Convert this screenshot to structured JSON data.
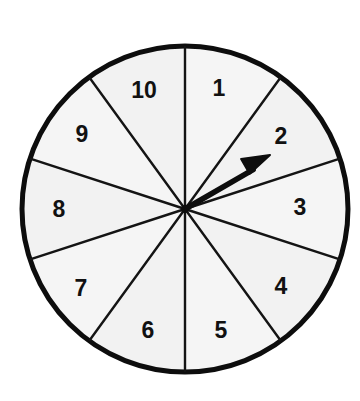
{
  "figure": {
    "kind": "probability-spinner",
    "background_color": "#ffffff"
  },
  "chart_data": {
    "type": "pie",
    "subtitle": "",
    "xlabel": "",
    "ylabel": "",
    "legend_position": "none",
    "grid": false,
    "equal_sectors": true,
    "sector_count": 10,
    "sector_angle_deg": 36,
    "start_angle_deg": 90,
    "direction": "clockwise",
    "categories": [
      "1",
      "2",
      "3",
      "4",
      "5",
      "6",
      "7",
      "8",
      "9",
      "10"
    ],
    "values": [
      36,
      36,
      36,
      36,
      36,
      36,
      36,
      36,
      36,
      36
    ],
    "units": "degrees",
    "pointer": {
      "label": "spinner-arrow",
      "points_to": "2",
      "angle_deg": 30,
      "tip_x": 270,
      "tip_y": 155
    },
    "annotations": []
  },
  "geometry": {
    "center_x": 185,
    "center_y": 209,
    "radius": 163,
    "rim_stroke_width": 5,
    "divider_stroke_width": 2.4,
    "label_radius": 112
  },
  "colors": {
    "rim": "#0d0d0d",
    "divider": "#141414",
    "sector_fill": "#f5f5f5",
    "sector_fill_alt": "#f2f2f2",
    "label_text": "#111111",
    "arrow": "#0d0d0d",
    "page_background": "#ffffff"
  },
  "sectors": [
    {
      "id": "sector-1",
      "label": "1",
      "mid_angle_deg": 72,
      "label_x": 219,
      "label_y": 90,
      "selected": false
    },
    {
      "id": "sector-2",
      "label": "2",
      "mid_angle_deg": 36,
      "label_x": 281,
      "label_y": 138,
      "selected": true
    },
    {
      "id": "sector-3",
      "label": "3",
      "mid_angle_deg": 0,
      "label_x": 300,
      "label_y": 209,
      "selected": false
    },
    {
      "id": "sector-4",
      "label": "4",
      "mid_angle_deg": -36,
      "label_x": 281,
      "label_y": 288,
      "selected": false
    },
    {
      "id": "sector-5",
      "label": "5",
      "mid_angle_deg": -72,
      "label_x": 221,
      "label_y": 332,
      "selected": false
    },
    {
      "id": "sector-6",
      "label": "6",
      "mid_angle_deg": -108,
      "label_x": 148,
      "label_y": 332,
      "selected": false
    },
    {
      "id": "sector-7",
      "label": "7",
      "mid_angle_deg": -144,
      "label_x": 81,
      "label_y": 290,
      "selected": false
    },
    {
      "id": "sector-8",
      "label": "8",
      "mid_angle_deg": 180,
      "label_x": 59,
      "label_y": 211,
      "selected": false
    },
    {
      "id": "sector-9",
      "label": "9",
      "mid_angle_deg": 144,
      "label_x": 82,
      "label_y": 136,
      "selected": false
    },
    {
      "id": "sector-10",
      "label": "10",
      "mid_angle_deg": 108,
      "label_x": 144,
      "label_y": 92,
      "selected": false
    }
  ]
}
